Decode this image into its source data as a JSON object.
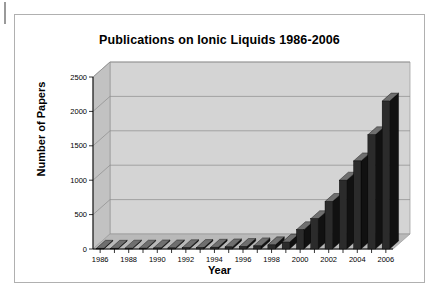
{
  "figure": {
    "title": "Publications on Ionic Liquids 1986-2006",
    "xlabel": "Year",
    "ylabel": "Number of Papers"
  },
  "chart_data": {
    "type": "bar",
    "title": "Publications on Ionic Liquids 1986-2006",
    "xlabel": "Year",
    "ylabel": "Number of Papers",
    "categories": [
      "1986",
      "1987",
      "1988",
      "1989",
      "1990",
      "1991",
      "1992",
      "1993",
      "1994",
      "1995",
      "1996",
      "1997",
      "1998",
      "1999",
      "2000",
      "2001",
      "2002",
      "2003",
      "2004",
      "2005",
      "2006"
    ],
    "values": [
      10,
      10,
      12,
      12,
      15,
      15,
      18,
      20,
      25,
      30,
      35,
      45,
      60,
      100,
      280,
      440,
      690,
      1000,
      1280,
      1660,
      2150
    ],
    "ylim": [
      0,
      2500
    ],
    "yticks": [
      0,
      500,
      1000,
      1500,
      2000,
      2500
    ],
    "ytick_labels": [
      "0",
      "500",
      "1000",
      "1500",
      "2000",
      "2500"
    ],
    "xtick_labels": [
      "1986",
      "1988",
      "1990",
      "1992",
      "1994",
      "1996",
      "1998",
      "2000",
      "2002",
      "2004",
      "2006"
    ],
    "grid": true,
    "legend": false,
    "style": "3d-column",
    "series_color": "#2b2b2b",
    "plot_background": "#d4d4d4"
  }
}
